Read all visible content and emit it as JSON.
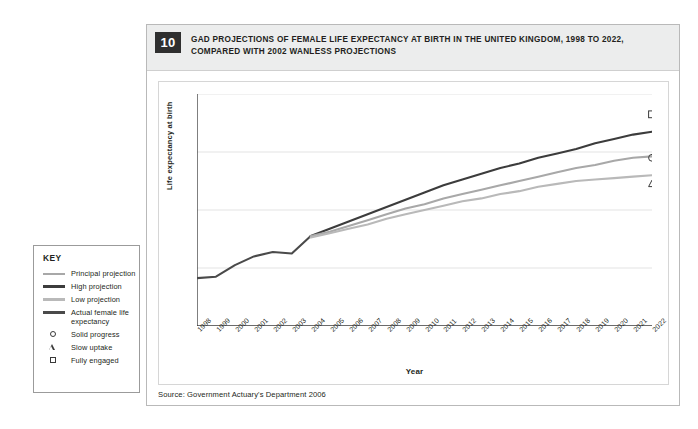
{
  "figure": {
    "number": "10",
    "title": "GAD PROJECTIONS OF FEMALE LIFE EXPECTANCY AT BIRTH IN THE UNITED KINGDOM, 1998 TO 2022, COMPARED WITH 2002 WANLESS PROJECTIONS",
    "source": "Source: Government Actuary's Department 2006"
  },
  "key": {
    "title": "KEY",
    "items": [
      {
        "label": "Principal projection",
        "type": "line",
        "color": "#a8a8a8"
      },
      {
        "label": "High projection",
        "type": "line",
        "color": "#3c3c3c"
      },
      {
        "label": "Low projection",
        "type": "line",
        "color": "#b9b9b9"
      },
      {
        "label": "Actual female life expectancy",
        "type": "line",
        "color": "#4a4a4a"
      },
      {
        "label": "Solid progress",
        "type": "marker",
        "marker": "circle"
      },
      {
        "label": "Slow uptake",
        "type": "marker",
        "marker": "triangle"
      },
      {
        "label": "Fully engaged",
        "type": "marker",
        "marker": "square"
      }
    ]
  },
  "chart_data": {
    "type": "line",
    "title": "GAD PROJECTIONS OF FEMALE LIFE EXPECTANCY AT BIRTH IN THE UNITED KINGDOM, 1998 TO 2022, COMPARED WITH 2002 WANLESS PROJECTIONS",
    "xlabel": "Year",
    "ylabel": "Life expectancy at birth",
    "ylim": [
      78,
      86
    ],
    "yticks": [
      78,
      80,
      82,
      84,
      86
    ],
    "grid": "horizontal",
    "legend_position": "external-left",
    "x": [
      1998,
      1999,
      2000,
      2001,
      2002,
      2003,
      2004,
      2005,
      2006,
      2007,
      2008,
      2009,
      2010,
      2011,
      2012,
      2013,
      2014,
      2015,
      2016,
      2017,
      2018,
      2019,
      2020,
      2021,
      2022
    ],
    "series": [
      {
        "name": "Actual female life expectancy",
        "color": "#4a4a4a",
        "x": [
          1998,
          1999,
          2000,
          2001,
          2002,
          2003,
          2004
        ],
        "values": [
          79.65,
          79.7,
          80.1,
          80.4,
          80.55,
          80.5,
          81.1
        ]
      },
      {
        "name": "High projection",
        "color": "#3c3c3c",
        "x": [
          2004,
          2005,
          2006,
          2007,
          2008,
          2009,
          2010,
          2011,
          2012,
          2013,
          2014,
          2015,
          2016,
          2017,
          2018,
          2019,
          2020,
          2021,
          2022
        ],
        "values": [
          81.1,
          81.35,
          81.6,
          81.85,
          82.1,
          82.35,
          82.6,
          82.85,
          83.05,
          83.25,
          83.45,
          83.6,
          83.8,
          83.95,
          84.1,
          84.3,
          84.45,
          84.6,
          84.7
        ]
      },
      {
        "name": "Principal projection",
        "color": "#a8a8a8",
        "x": [
          2004,
          2005,
          2006,
          2007,
          2008,
          2009,
          2010,
          2011,
          2012,
          2013,
          2014,
          2015,
          2016,
          2017,
          2018,
          2019,
          2020,
          2021,
          2022
        ],
        "values": [
          81.1,
          81.25,
          81.45,
          81.65,
          81.85,
          82.05,
          82.2,
          82.4,
          82.55,
          82.7,
          82.85,
          83.0,
          83.15,
          83.3,
          83.45,
          83.55,
          83.7,
          83.8,
          83.85
        ]
      },
      {
        "name": "Low projection",
        "color": "#b9b9b9",
        "x": [
          2004,
          2005,
          2006,
          2007,
          2008,
          2009,
          2010,
          2011,
          2012,
          2013,
          2014,
          2015,
          2016,
          2017,
          2018,
          2019,
          2020,
          2021,
          2022
        ],
        "values": [
          81.05,
          81.2,
          81.35,
          81.5,
          81.7,
          81.85,
          82.0,
          82.15,
          82.3,
          82.4,
          82.55,
          82.65,
          82.8,
          82.9,
          83.0,
          83.05,
          83.1,
          83.15,
          83.2
        ]
      }
    ],
    "markers": [
      {
        "name": "Fully engaged",
        "shape": "square",
        "x": 2022,
        "y": 85.3
      },
      {
        "name": "Solid progress",
        "shape": "circle",
        "x": 2022,
        "y": 83.8
      },
      {
        "name": "Slow uptake",
        "shape": "triangle",
        "x": 2022,
        "y": 82.9
      }
    ]
  }
}
